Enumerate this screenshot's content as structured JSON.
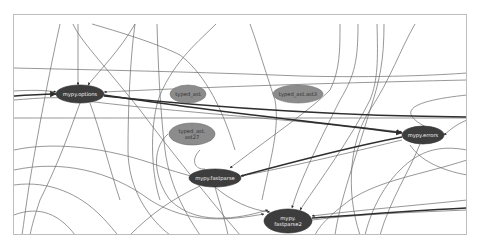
{
  "diagram": {
    "type": "dependency-graph",
    "colors": {
      "background": "#ffffff",
      "frame_border": "#bdbdbd",
      "edge": "#6a6a6a",
      "edge_heavy": "#2e2e2e",
      "node_dark": "#3d3d3d",
      "node_light": "#8c8c8c",
      "label_on_dark": "#f2f2f2",
      "label_on_light": "#333333"
    },
    "nodes": [
      {
        "id": "mypy_options",
        "label": "mypy.options",
        "lines": [
          "mypy.options"
        ],
        "style": "dark",
        "cx": 80,
        "cy": 94,
        "rx": 24,
        "ry": 9
      },
      {
        "id": "typed_ast",
        "label": "typed_ast",
        "lines": [
          "typed_ast"
        ],
        "style": "light",
        "cx": 188,
        "cy": 94,
        "rx": 18,
        "ry": 9
      },
      {
        "id": "typed_ast_ast3",
        "label": "typed_ast.ast3",
        "lines": [
          "typed_ast.ast3"
        ],
        "style": "light",
        "cx": 298,
        "cy": 94,
        "rx": 25,
        "ry": 9
      },
      {
        "id": "typed_ast_ast27",
        "label": "typed_ast.ast27",
        "lines": [
          "typed_ast.",
          "ast27"
        ],
        "style": "light",
        "cx": 192,
        "cy": 134,
        "rx": 23,
        "ry": 11
      },
      {
        "id": "mypy_errors",
        "label": "mypy.errors",
        "lines": [
          "mypy.errors"
        ],
        "style": "dark",
        "cx": 423,
        "cy": 135,
        "rx": 21,
        "ry": 9
      },
      {
        "id": "mypy_fastparse",
        "label": "mypy.fastparse",
        "lines": [
          "mypy.fastparse"
        ],
        "style": "dark",
        "cx": 215,
        "cy": 178,
        "rx": 26,
        "ry": 9
      },
      {
        "id": "mypy_fastparse2",
        "label": "mypy.fastparse2",
        "lines": [
          "mypy.",
          "fastparse2"
        ],
        "style": "dark",
        "cx": 288,
        "cy": 221,
        "rx": 24,
        "ry": 12
      }
    ],
    "edges": [
      {
        "d": "M60 24 C52 60 40 120 30 180 C26 205 24 222 22 235"
      },
      {
        "d": "M73 24 C80 40 100 60 140 110 C170 150 210 200 240 235"
      },
      {
        "d": "M78 24 L78 85",
        "arrow_to": "mypy_options"
      },
      {
        "d": "M135 24 C120 50 100 70 88 85",
        "arrow_to": "mypy_options"
      },
      {
        "d": "M135 24 C130 60 128 110 128 150 C128 190 150 220 170 235"
      },
      {
        "d": "M92 24 C130 35 160 45 180 55 C200 70 220 100 235 150"
      },
      {
        "d": "M157 24 C158 60 160 110 165 150 C170 190 190 220 200 235"
      },
      {
        "d": "M216 24 C200 40 175 60 160 95 C150 120 150 170 160 200"
      },
      {
        "d": "M250 24 C256 40 265 70 275 100 C280 130 270 160 262 200"
      },
      {
        "d": "M340 24 C340 50 340 70 330 90 C310 110 280 130 230 168",
        "arrow_to": "mypy_fastparse"
      },
      {
        "d": "M358 24 C358 60 355 75 340 100 C320 140 300 180 292 208",
        "arrow_to": "mypy_fastparse2"
      },
      {
        "d": "M377 24 C378 60 378 80 370 100 C350 140 320 180 300 210",
        "arrow_to": "mypy_fastparse2"
      },
      {
        "d": "M384 24 C384 60 380 80 370 110 C355 160 340 200 335 235"
      },
      {
        "d": "M415 24 C400 50 390 80 370 110 C350 140 345 190 360 235"
      },
      {
        "d": "M14 68 C100 70 200 72 300 76 C380 78 440 75 467 73"
      },
      {
        "d": "M14 91 C30 90 45 90 56 92",
        "arrow_to": "mypy_options"
      },
      {
        "d": "M467 80 C380 82 250 85 104 92",
        "arrow_to": "mypy_options"
      },
      {
        "d": "M14 118 C150 118 300 118 467 118"
      },
      {
        "d": "M14 100 C40 98 60 96 80 100 C150 110 300 120 402 132",
        "arrow_to": "mypy_errors"
      },
      {
        "d": "M14 150 C60 140 120 150 170 170 C190 176 200 178 190 178",
        "arrow_to": "mypy_fastparse"
      },
      {
        "d": "M14 170 C60 160 110 170 150 200 C190 225 230 220 264 214",
        "arrow_to": "mypy_fastparse2"
      },
      {
        "d": "M14 185 C50 180 80 195 100 215 C110 225 115 232 118 235"
      },
      {
        "d": "M14 215 C40 205 60 215 75 235"
      },
      {
        "d": "M467 95 C420 100 380 110 444 135",
        "arrow_to": "mypy_errors"
      },
      {
        "d": "M467 120 C455 125 450 130 444 135",
        "arrow_to": "mypy_errors"
      },
      {
        "d": "M467 150 C440 145 420 150 400 170 C380 190 370 215 365 235"
      },
      {
        "d": "M467 160 C420 175 380 180 350 200 C330 215 320 225 315 235"
      },
      {
        "d": "M467 175 C440 170 420 160 410 145"
      },
      {
        "d": "M467 200 C420 205 360 210 312 216",
        "arrow_to": "mypy_fastparse2"
      },
      {
        "d": "M467 210 C420 212 360 214 312 220"
      },
      {
        "d": "M402 140 C360 150 300 165 241 176",
        "arrow_to": "mypy_fastparse"
      },
      {
        "d": "M420 144 C410 170 390 200 380 235"
      },
      {
        "d": "M200 150 C190 160 195 170 205 169"
      },
      {
        "d": "M168 134 C150 150 155 180 170 200 C200 230 250 215 268 210",
        "arrow_to": "mypy_fastparse2"
      },
      {
        "d": "M215 187 C230 200 250 210 270 212",
        "arrow_to": "mypy_fastparse2"
      },
      {
        "d": "M215 187 C220 205 225 220 228 235"
      },
      {
        "d": "M200 186 C170 200 150 215 130 235"
      },
      {
        "d": "M80 103 C70 130 60 160 40 200 C35 215 32 225 30 235"
      },
      {
        "d": "M90 103 C100 130 110 170 120 200"
      }
    ],
    "heavy_edges": [
      {
        "d": "M104 95 C200 110 300 120 402 133",
        "arrow_to": "mypy_errors"
      },
      {
        "d": "M104 96 C220 108 340 116 467 117"
      },
      {
        "d": "M14 96 C30 95 45 94 56 94",
        "arrow_to": "mypy_options"
      },
      {
        "d": "M241 176 C300 160 360 145 402 137",
        "arrow_from": "mypy_errors"
      },
      {
        "d": "M312 218 C360 215 420 210 467 208"
      }
    ]
  }
}
